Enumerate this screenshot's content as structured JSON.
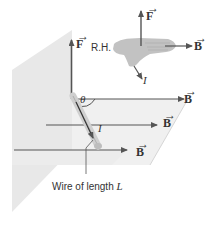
{
  "diagram": {
    "type": "physics-vector-diagram",
    "labels": {
      "force_main": "F",
      "force_hand": "F",
      "field_top": "B",
      "field_middle": "B",
      "field_bottom": "B",
      "field_hand": "B",
      "angle": "θ",
      "current_wire": "I",
      "current_hand": "I",
      "right_hand": "R.H.",
      "wire_caption": "Wire of length ",
      "wire_caption_var": "L"
    },
    "colors": {
      "arrow": "#555555",
      "plane_vertical": "#e6e6e6",
      "plane_horizontal": "#efefef",
      "wire": "#d8d8d8",
      "hand": "#bdbdbd",
      "text": "#333333"
    }
  }
}
